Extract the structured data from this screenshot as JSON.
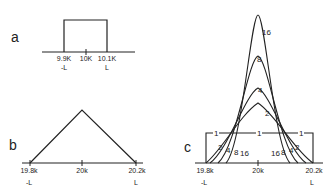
{
  "panels": {
    "a": {
      "label": "a",
      "ticks": [
        "9.9K",
        "10K",
        "10.1K"
      ],
      "sub_ticks": [
        "-L",
        "L"
      ],
      "shape": "rectangle"
    },
    "b": {
      "label": "b",
      "ticks": [
        "19.8k",
        "20k",
        "20.2k"
      ],
      "sub_ticks": [
        "-L",
        "L"
      ],
      "shape": "triangle"
    },
    "c": {
      "label": "c",
      "ticks": [
        "19.8k",
        "20k",
        "20.2k"
      ],
      "sub_ticks": [
        "-L",
        "L"
      ],
      "shape": "family of peaked curves",
      "curve_labels": [
        "1",
        "2",
        "4",
        "8",
        "16"
      ],
      "peak_labels": [
        "16",
        "8",
        "4",
        "2"
      ],
      "flat_labels": [
        "1",
        "1",
        "1"
      ],
      "left_labels": [
        "2",
        "4",
        "8",
        "16"
      ],
      "right_labels": [
        "16",
        "8",
        "4",
        "2"
      ]
    }
  },
  "colors": {
    "stroke": "#222222",
    "background": "#ffffff"
  }
}
